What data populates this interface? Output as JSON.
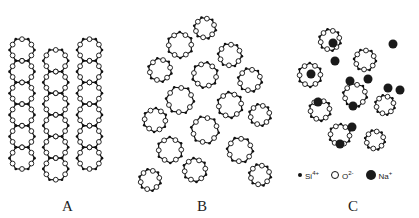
{
  "diagram": {
    "panels": [
      {
        "id": "A",
        "label": "A",
        "description": "ordered crystalline silica network"
      },
      {
        "id": "B",
        "label": "B",
        "description": "random silica glass network"
      },
      {
        "id": "C",
        "label": "C",
        "description": "sodium silicate glass network with Na+ modifiers"
      }
    ],
    "legend": {
      "si": {
        "label": "Si",
        "charge": "4+"
      },
      "o": {
        "label": "O",
        "charge": "2-"
      },
      "na": {
        "label": "Na",
        "charge": "+"
      }
    },
    "colors": {
      "line": "#111111",
      "background": "#ffffff",
      "na_fill": "#1a1a1a"
    }
  }
}
